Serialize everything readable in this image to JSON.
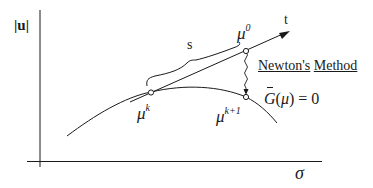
{
  "diagram": {
    "axes": {
      "y_label": "|u|",
      "x_label": "σ"
    },
    "points": {
      "mu_k": {
        "base": "μ",
        "superscript": "k"
      },
      "mu_0": {
        "base": "μ",
        "superscript": "0"
      },
      "mu_k1": {
        "base": "μ",
        "superscript": "k+1"
      }
    },
    "tangent_label": "t",
    "step_label": "s",
    "method_label": {
      "word1": "Newton's",
      "word2": "Method"
    },
    "equation": {
      "func": "G",
      "open": "(",
      "arg": "μ",
      "close": ")",
      "rhs": " = 0"
    },
    "colors": {
      "line": "#1a1a1a",
      "background": "#ffffff"
    }
  }
}
